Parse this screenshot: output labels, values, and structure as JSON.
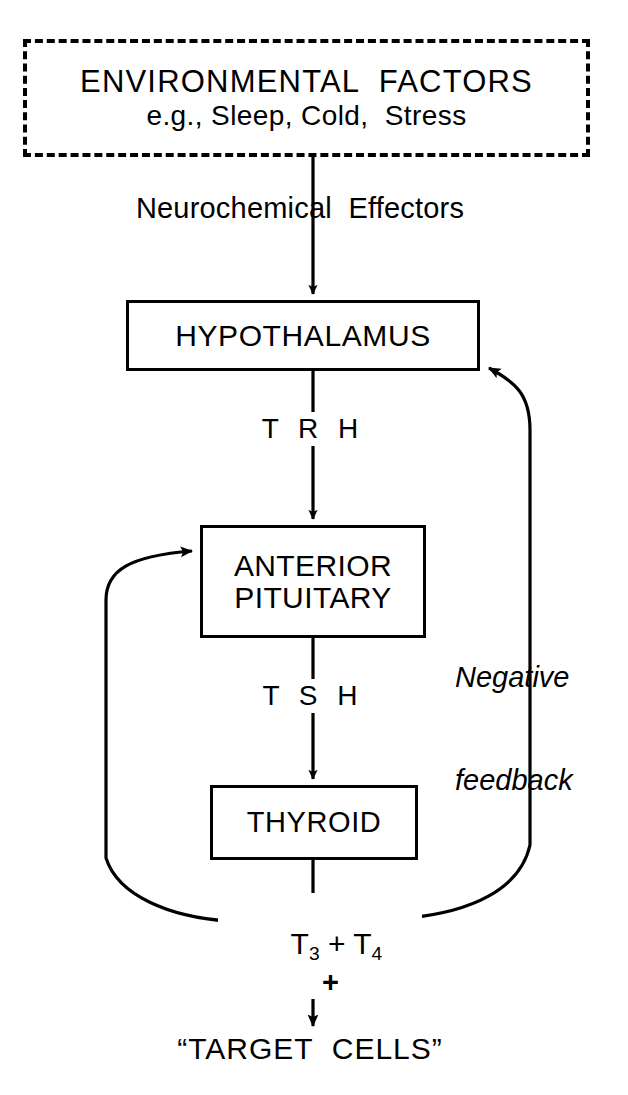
{
  "diagram": {
    "stroke_color": "#000000",
    "background_color": "#ffffff",
    "nodes": {
      "environmental_factors": {
        "line1": "ENVIRONMENTAL  FACTORS",
        "line2": "e.g., Sleep, Cold,  Stress",
        "border_style": "dashed"
      },
      "hypothalamus": {
        "label": "HYPOTHALAMUS",
        "border_style": "solid"
      },
      "anterior_pituitary": {
        "line1": "ANTERIOR",
        "line2": "PITUITARY",
        "border_style": "solid"
      },
      "thyroid": {
        "label": "THYROID",
        "border_style": "solid"
      },
      "target_cells": {
        "label": "“TARGET  CELLS”"
      }
    },
    "edge_labels": {
      "neurochemical_effectors": "Neurochemical  Effectors",
      "trh": "T R H",
      "tsh": "T S H",
      "negative_feedback_line1": "Negative",
      "negative_feedback_line2": "feedback",
      "hormones_t3": "T",
      "hormones_t3_sub": "3",
      "hormones_operator": " + ",
      "hormones_t4": "T",
      "hormones_t4_sub": "4",
      "stimulation_plus": "+"
    },
    "icons": {
      "arrow_down": "arrow-down-icon",
      "arrow_feedback": "feedback-arrow-icon"
    }
  }
}
